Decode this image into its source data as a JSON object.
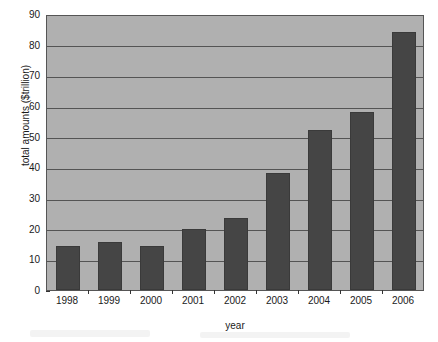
{
  "chart_data": {
    "type": "bar",
    "title": "",
    "xlabel": "year",
    "ylabel": "total amounts ($trillion)",
    "categories": [
      "1998",
      "1999",
      "2000",
      "2001",
      "2002",
      "2003",
      "2004",
      "2005",
      "2006"
    ],
    "values": [
      14.3,
      15.7,
      14.3,
      19.9,
      23.6,
      38.1,
      52.3,
      58.0,
      84.0
    ],
    "ylim": [
      0,
      90
    ],
    "ytick_step": 10,
    "yticks": [
      "0",
      "10",
      "20",
      "30",
      "40",
      "50",
      "60",
      "70",
      "80",
      "90"
    ],
    "grid": true,
    "legend": "none",
    "series_name": "total amounts",
    "bar_color": "#454545",
    "plot_background": "#b0b0b0",
    "gridline_color": "#545454",
    "axis_color": "#333333",
    "figure_background": "#ffffff"
  }
}
